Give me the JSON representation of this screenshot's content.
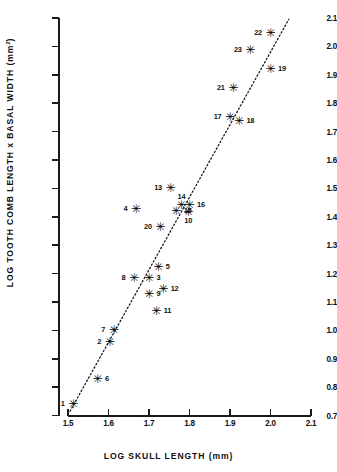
{
  "chart_data": {
    "type": "scatter",
    "title": "",
    "xlabel": "LOG  SKULL  LENGTH  (mm)",
    "ylabel": "LOG TOOTH COMB LENGTH x BASAL WIDTH  (mm2)",
    "xlim": [
      1.5,
      2.1
    ],
    "ylim": [
      0.7,
      2.1
    ],
    "xticks": [
      "1.5",
      "1.6",
      "1.7",
      "1.8",
      "1.9",
      "2.0",
      "2.1"
    ],
    "yticks": [
      "0.7",
      "0.8",
      "0.9",
      "1.0",
      "1.1",
      "1.2",
      "1.3",
      "1.4",
      "1.5",
      "1.6",
      "1.7",
      "1.8",
      "1.9",
      "2.0",
      "2.1"
    ],
    "grid": false,
    "legend": "none",
    "marker": "asterisk",
    "trend_line": {
      "style": "dotted",
      "x0": 1.505,
      "y0": 0.715,
      "x1": 2.045,
      "y1": 2.095
    },
    "points": [
      {
        "label": "1",
        "x": 1.513,
        "y": 0.742,
        "pos": "l"
      },
      {
        "label": "2",
        "x": 1.603,
        "y": 0.96,
        "pos": "l"
      },
      {
        "label": "3",
        "x": 1.7,
        "y": 1.183,
        "pos": "r"
      },
      {
        "label": "4",
        "x": 1.668,
        "y": 1.427,
        "pos": "l"
      },
      {
        "label": "5",
        "x": 1.723,
        "y": 1.223,
        "pos": "r"
      },
      {
        "label": "6",
        "x": 1.573,
        "y": 0.827,
        "pos": "r"
      },
      {
        "label": "7",
        "x": 1.613,
        "y": 1.0,
        "pos": "l"
      },
      {
        "label": "8",
        "x": 1.663,
        "y": 1.185,
        "pos": "l"
      },
      {
        "label": "9",
        "x": 1.7,
        "y": 1.128,
        "pos": "r"
      },
      {
        "label": "10",
        "x": 1.797,
        "y": 1.417,
        "pos": "b"
      },
      {
        "label": "11",
        "x": 1.718,
        "y": 1.068,
        "pos": "r"
      },
      {
        "label": "12",
        "x": 1.735,
        "y": 1.145,
        "pos": "r"
      },
      {
        "label": "13",
        "x": 1.753,
        "y": 1.502,
        "pos": "l"
      },
      {
        "label": "14",
        "x": 1.78,
        "y": 1.443,
        "pos": "t"
      },
      {
        "label": "15",
        "x": 1.767,
        "y": 1.42,
        "pos": "r"
      },
      {
        "label": "16",
        "x": 1.8,
        "y": 1.44,
        "pos": "r"
      },
      {
        "label": "17",
        "x": 1.9,
        "y": 1.75,
        "pos": "l"
      },
      {
        "label": "18",
        "x": 1.922,
        "y": 1.738,
        "pos": "r"
      },
      {
        "label": "19",
        "x": 2.0,
        "y": 1.922,
        "pos": "r"
      },
      {
        "label": "20",
        "x": 1.728,
        "y": 1.365,
        "pos": "l"
      },
      {
        "label": "21",
        "x": 1.908,
        "y": 1.852,
        "pos": "l"
      },
      {
        "label": "22",
        "x": 2.0,
        "y": 2.047,
        "pos": "l"
      },
      {
        "label": "23",
        "x": 1.95,
        "y": 1.988,
        "pos": "l"
      }
    ]
  }
}
